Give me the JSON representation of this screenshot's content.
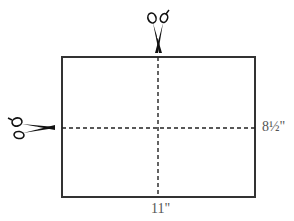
{
  "diagram": {
    "labels": {
      "width": "11\"",
      "height": "8½\""
    },
    "icons": {
      "top": "scissors-icon",
      "left": "scissors-icon"
    },
    "colors": {
      "border": "#333333",
      "dash": "#222222",
      "label": "#555555"
    }
  }
}
